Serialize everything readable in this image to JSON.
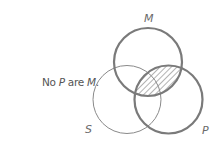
{
  "caption": {
    "prefix": "No ",
    "subject": "P",
    "middle": " are ",
    "predicate": "M",
    "suffix": "."
  },
  "diagram": {
    "type": "venn",
    "circles": [
      {
        "label": "M",
        "cx": 148,
        "cy": 62,
        "r": 34,
        "stroke": "#7a7a7a",
        "stroke_width": 2.2
      },
      {
        "label": "S",
        "cx": 127,
        "cy": 99.5,
        "r": 34,
        "stroke": "#8a8a8a",
        "stroke_width": 1
      },
      {
        "label": "P",
        "cx": 168.5,
        "cy": 99.5,
        "r": 34,
        "stroke": "#7a7a7a",
        "stroke_width": 2.2
      }
    ],
    "shaded_region": "M ∩ P",
    "hatch_color": "#8a8a8a"
  }
}
